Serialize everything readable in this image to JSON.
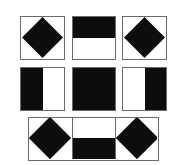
{
  "puzzle": {
    "description": "Visual pattern puzzle: 3x3 arrangement of square tiles with black shapes",
    "rows": [
      {
        "cells": [
          "diamond",
          "top-half-black",
          "diamond"
        ]
      },
      {
        "cells": [
          "left-half-black",
          "full-black",
          "right-half-black"
        ]
      },
      {
        "cells": [
          "diamond",
          "bottom-half-black",
          "diamond"
        ],
        "joined": true
      }
    ],
    "colors": {
      "fill": "#0d0d0d",
      "border": "#6a6a6a",
      "background": "#ffffff"
    }
  }
}
